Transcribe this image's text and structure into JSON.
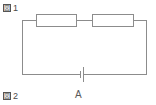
{
  "figure": {
    "type": "electric-circuit-schematic",
    "background_color": "#ffffff",
    "line_color": "#8c8c8c",
    "text_color": "#4a4a4a"
  },
  "labels": {
    "figure_1": "図 1",
    "figure_1_glyph": "図",
    "figure_1_number": "1",
    "figure_2": "図 2",
    "figure_2_glyph": "図",
    "figure_2_number": "2",
    "cell_label": "A"
  },
  "components": [
    {
      "id": "resistor-1",
      "name": "resistor-left",
      "symbol": "rectangle",
      "label": "",
      "position": "top-wire-left"
    },
    {
      "id": "resistor-2",
      "name": "resistor-right",
      "symbol": "rectangle",
      "label": "",
      "position": "top-wire-right"
    },
    {
      "id": "battery-cell",
      "name": "battery-cell",
      "symbol": "single-cell",
      "label": "A",
      "position": "bottom-wire-center"
    }
  ],
  "wires": {
    "top": "closed",
    "bottom": "closed",
    "left": "closed",
    "right": "closed"
  }
}
